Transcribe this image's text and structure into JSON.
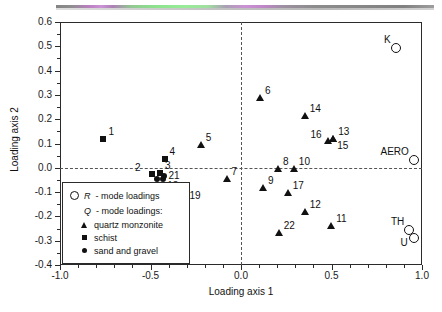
{
  "chart_data": {
    "type": "scatter",
    "title": "",
    "xlabel": "Loading axis 1",
    "ylabel": "Loading axis 2",
    "xlim": [
      -1.0,
      1.0
    ],
    "ylim": [
      -0.4,
      0.6
    ],
    "xticks": [
      -1.0,
      -0.5,
      0.0,
      0.5,
      1.0
    ],
    "xticklabels": [
      "-1.0",
      "-0.5",
      "0.0",
      "0.5",
      "1.0"
    ],
    "yticks": [
      -0.4,
      -0.3,
      -0.2,
      -0.1,
      0.0,
      0.1,
      0.2,
      0.3,
      0.4,
      0.5,
      0.6
    ],
    "yticklabels": [
      "-0.4",
      "-0.3",
      "-0.2",
      "-0.1",
      "0.0",
      "0.1",
      "0.2",
      "0.3",
      "0.4",
      "0.5",
      "0.6"
    ],
    "grid": false,
    "zero_lines": true,
    "legend_position": "lower-left",
    "series": [
      {
        "name": "R - mode loadings",
        "marker": "open-circle",
        "points": [
          {
            "label": "K",
            "x": 0.855,
            "y": 0.495,
            "label_pos": "left"
          },
          {
            "label": "AERO",
            "x": 0.955,
            "y": 0.033,
            "label_pos": "left"
          },
          {
            "label": "TH",
            "x": 0.93,
            "y": -0.258,
            "label_pos": "left"
          },
          {
            "label": "U",
            "x": 0.955,
            "y": -0.288,
            "label_pos": "left-below"
          }
        ]
      },
      {
        "name": "quartz monzonite",
        "marker": "triangle",
        "points": [
          {
            "label": "5",
            "x": -0.222,
            "y": 0.095,
            "label_pos": "upper-right"
          },
          {
            "label": "6",
            "x": 0.105,
            "y": 0.288,
            "label_pos": "upper-right"
          },
          {
            "label": "7",
            "x": -0.08,
            "y": -0.047,
            "label_pos": "upper-right"
          },
          {
            "label": "8",
            "x": 0.205,
            "y": -0.003,
            "label_pos": "upper-right"
          },
          {
            "label": "9",
            "x": 0.122,
            "y": -0.082,
            "label_pos": "upper-right"
          },
          {
            "label": "10",
            "x": 0.292,
            "y": -0.005,
            "label_pos": "upper-right"
          },
          {
            "label": "11",
            "x": 0.498,
            "y": -0.238,
            "label_pos": "upper-right"
          },
          {
            "label": "12",
            "x": 0.352,
            "y": -0.18,
            "label_pos": "upper-right"
          },
          {
            "label": "13",
            "x": 0.51,
            "y": 0.118,
            "label_pos": "upper-right"
          },
          {
            "label": "14",
            "x": 0.352,
            "y": 0.215,
            "label_pos": "upper-right"
          },
          {
            "label": "15",
            "x": 0.51,
            "y": 0.118,
            "label_pos": "lower-right"
          },
          {
            "label": "16",
            "x": 0.478,
            "y": 0.11,
            "label_pos": "upper-left"
          },
          {
            "label": "17",
            "x": 0.258,
            "y": -0.103,
            "label_pos": "upper-right"
          },
          {
            "label": "22",
            "x": 0.208,
            "y": -0.268,
            "label_pos": "upper-right"
          }
        ]
      },
      {
        "name": "schist",
        "marker": "square",
        "points": [
          {
            "label": "1",
            "x": -0.76,
            "y": 0.118,
            "label_pos": "upper-right"
          },
          {
            "label": "2",
            "x": -0.492,
            "y": -0.025,
            "label_pos": "upper-left"
          },
          {
            "label": "3",
            "x": -0.447,
            "y": -0.022,
            "label_pos": "upper-right"
          },
          {
            "label": "4",
            "x": -0.422,
            "y": 0.038,
            "label_pos": "upper-right"
          }
        ]
      },
      {
        "name": "sand and gravel",
        "marker": "filled-circle",
        "points": [
          {
            "label": "18",
            "x": -0.43,
            "y": -0.048,
            "label_pos": "lower-right"
          },
          {
            "label": "19",
            "x": -0.312,
            "y": -0.118,
            "label_pos": "right"
          },
          {
            "label": "20",
            "x": -0.462,
            "y": -0.047,
            "label_pos": "lower-left"
          },
          {
            "label": "21",
            "x": -0.428,
            "y": -0.035,
            "label_pos": "right"
          }
        ]
      }
    ]
  },
  "legend": {
    "r_symbol_label": "R",
    "r_text": "- mode loadings",
    "q_symbol_label": "Q",
    "q_text": "- mode loadings:",
    "items": [
      {
        "symbol": "triangle",
        "label": "quartz monzonite"
      },
      {
        "symbol": "square",
        "label": "schist"
      },
      {
        "symbol": "filled-circle",
        "label": "sand and gravel"
      }
    ]
  }
}
